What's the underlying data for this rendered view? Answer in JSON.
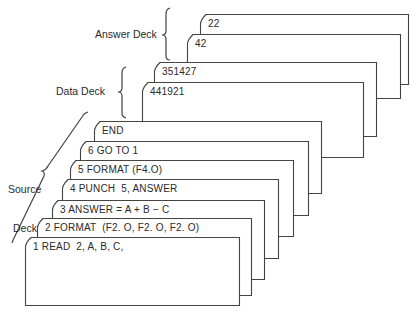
{
  "diagram": {
    "line_color": "#444444",
    "decks": [
      {
        "name": "answer",
        "label": "Answer Deck"
      },
      {
        "name": "data",
        "label": "Data Deck"
      },
      {
        "name": "source",
        "label_line1": "Source",
        "label_line2": "Deck"
      }
    ],
    "cards": [
      {
        "deck": "answer",
        "text": "22",
        "x": 200,
        "y": 14,
        "right": 409,
        "bottom": 85
      },
      {
        "deck": "answer",
        "text": "42",
        "x": 187,
        "y": 34,
        "right": 401,
        "bottom": 99
      },
      {
        "deck": "data",
        "text": "351427",
        "x": 154,
        "y": 62,
        "right": 377,
        "bottom": 137
      },
      {
        "deck": "data",
        "text": "441921",
        "x": 142,
        "y": 82,
        "right": 364,
        "bottom": 158
      },
      {
        "deck": "source",
        "text": "END",
        "x": 94,
        "y": 121,
        "right": 322,
        "bottom": 194
      },
      {
        "deck": "source",
        "text": "6 GO TO 1",
        "x": 80,
        "y": 141,
        "right": 309,
        "bottom": 216
      },
      {
        "deck": "source",
        "text": "5 FORMAT (F4.O)",
        "x": 70,
        "y": 160,
        "right": 294,
        "bottom": 237
      },
      {
        "deck": "source",
        "text": "4 PUNCH  5, ANSWER",
        "x": 62,
        "y": 179,
        "right": 279,
        "bottom": 259
      },
      {
        "deck": "source",
        "text": "3 ANSWER = A + B − C",
        "x": 52,
        "y": 200,
        "right": 265,
        "bottom": 280
      },
      {
        "deck": "source",
        "text": "2 FORMAT  (F2. O, F2. O, F2. O)",
        "x": 37,
        "y": 218,
        "right": 252,
        "bottom": 296
      },
      {
        "deck": "source",
        "text": "1 READ  2, A, B, C,",
        "x": 25,
        "y": 237,
        "right": 240,
        "bottom": 306
      }
    ]
  }
}
